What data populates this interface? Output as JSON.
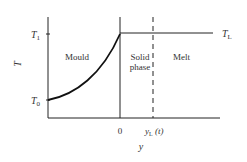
{
  "diagram": {
    "y_axis_label": "T",
    "x_axis_label": "y",
    "ticks": {
      "T1": {
        "main": "T",
        "sub": "1"
      },
      "T0": {
        "main": "T",
        "sub": "0"
      },
      "TL": {
        "main": "T",
        "sub": "L"
      },
      "zero": "0",
      "yL": {
        "main": "y",
        "sub": "L",
        "suffix": " (t)"
      }
    },
    "regions": {
      "mould": "Mould",
      "solid_line1": "Solid",
      "solid_line2": "phase",
      "melt": "Melt"
    },
    "colors": {
      "line": "#222222",
      "text": "#333333"
    }
  }
}
